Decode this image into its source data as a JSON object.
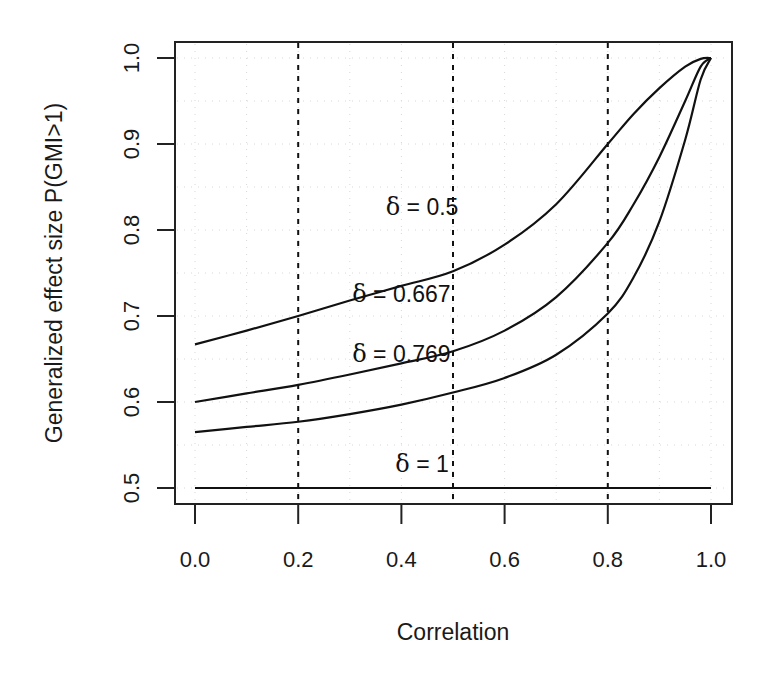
{
  "chart_data": {
    "type": "line",
    "title": "",
    "xlabel": "Correlation",
    "ylabel": "Generalized effect size P(GMI>1)",
    "xlim": [
      0.0,
      1.0
    ],
    "ylim": [
      0.5,
      1.0
    ],
    "xticks": [
      "0.0",
      "0.2",
      "0.4",
      "0.6",
      "0.8",
      "1.0"
    ],
    "yticks": [
      "0.5",
      "0.6",
      "0.7",
      "0.8",
      "0.9",
      "1.0"
    ],
    "grid": "faint dotted",
    "reference_lines": {
      "type": "vertical dashed",
      "x": [
        0.2,
        0.5,
        0.8
      ]
    },
    "legend": "none (inline labels)",
    "series": [
      {
        "name": "δ = 0.5",
        "label": "δ = 0.5",
        "x": [
          0.0,
          0.1,
          0.2,
          0.3,
          0.4,
          0.5,
          0.6,
          0.7,
          0.8,
          0.85,
          0.9,
          0.95,
          0.98,
          1.0
        ],
        "values": [
          0.667,
          0.683,
          0.7,
          0.718,
          0.735,
          0.752,
          0.783,
          0.83,
          0.9,
          0.935,
          0.965,
          0.99,
          0.999,
          1.0
        ]
      },
      {
        "name": "δ = 0.667",
        "label": "δ = 0.667",
        "x": [
          0.0,
          0.1,
          0.2,
          0.3,
          0.4,
          0.5,
          0.6,
          0.7,
          0.8,
          0.85,
          0.9,
          0.95,
          0.98,
          1.0
        ],
        "values": [
          0.6,
          0.61,
          0.62,
          0.632,
          0.645,
          0.659,
          0.683,
          0.722,
          0.785,
          0.83,
          0.885,
          0.95,
          0.99,
          1.0
        ]
      },
      {
        "name": "δ = 0.769",
        "label": "δ = 0.769",
        "x": [
          0.0,
          0.1,
          0.2,
          0.3,
          0.4,
          0.5,
          0.6,
          0.7,
          0.8,
          0.85,
          0.9,
          0.95,
          0.98,
          1.0
        ],
        "values": [
          0.565,
          0.571,
          0.577,
          0.586,
          0.597,
          0.611,
          0.628,
          0.655,
          0.703,
          0.745,
          0.81,
          0.905,
          0.975,
          1.0
        ]
      },
      {
        "name": "δ = 1",
        "label": "δ = 1",
        "x": [
          0.0,
          1.0
        ],
        "values": [
          0.5,
          0.5
        ]
      }
    ],
    "annotations": [
      {
        "text": "δ = 0.5",
        "x": 0.44,
        "y": 0.817
      },
      {
        "text": "δ = 0.667",
        "x": 0.4,
        "y": 0.716
      },
      {
        "text": "δ = 0.769",
        "x": 0.4,
        "y": 0.646
      },
      {
        "text": "δ = 1",
        "x": 0.44,
        "y": 0.519
      }
    ]
  },
  "labels": {
    "xlabel": "Correlation",
    "ylabel": "Generalized effect size P(GMI>1)",
    "delta_symbol": "δ",
    "curve_labels": [
      "= 0.5",
      "= 0.667",
      "= 0.769",
      "= 1"
    ]
  },
  "colors": {
    "line": "#111111",
    "frame": "#222222",
    "grid": "#d8d8d8"
  }
}
